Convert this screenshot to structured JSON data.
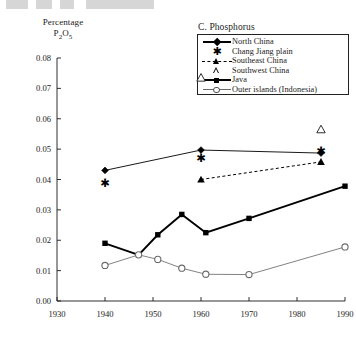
{
  "figure": {
    "panel_title": "C. Phosphorus",
    "y_axis_label_line1": "Percentage",
    "y_axis_label_line2_main": "P",
    "y_axis_label_sub1": "2",
    "y_axis_label_mid": "O",
    "y_axis_label_sub2": "5"
  },
  "legend": {
    "items": [
      {
        "label": "North China",
        "key": "line-diamond",
        "color": "#000000"
      },
      {
        "label": "Chang Jiang plain",
        "key": "star",
        "color": "#000000"
      },
      {
        "label": "Southeast China",
        "key": "dashed-triangle",
        "color": "#000000"
      },
      {
        "label": "Southwest China",
        "key": "open-triangle",
        "color": "#000000"
      },
      {
        "label": "Java",
        "key": "thick-line-square",
        "color": "#000000"
      },
      {
        "label": "Outer islands (Indonesia)",
        "key": "thin-line-circle",
        "color": "#6b6b6b"
      }
    ]
  },
  "chart_data": {
    "type": "line",
    "title": "C. Phosphorus",
    "xlabel": "",
    "ylabel": "Percentage P2O5",
    "xlim": [
      1930,
      1990
    ],
    "ylim": [
      0.0,
      0.08
    ],
    "xticks": [
      1930,
      1940,
      1950,
      1960,
      1970,
      1980,
      1990
    ],
    "xticklabels": [
      "1930",
      "1940",
      "1950",
      "1960",
      "1970",
      "1980",
      "1990"
    ],
    "yticks": [
      0.0,
      0.01,
      0.02,
      0.03,
      0.04,
      0.05,
      0.06,
      0.07,
      0.08
    ],
    "yticklabels": [
      "0.00",
      "0.01",
      "0.02",
      "0.03",
      "0.04",
      "0.05",
      "0.06",
      "0.07",
      "0.08"
    ],
    "grid": false,
    "legend_position": "top-right",
    "series": [
      {
        "name": "North China",
        "marker": "diamond",
        "linestyle": "solid",
        "color": "#000000",
        "points": [
          {
            "x": 1940,
            "y": 0.043
          },
          {
            "x": 1960,
            "y": 0.0497
          },
          {
            "x": 1985,
            "y": 0.0487
          }
        ]
      },
      {
        "name": "Chang Jiang plain",
        "marker": "star",
        "linestyle": "none",
        "color": "#000000",
        "points": [
          {
            "x": 1940,
            "y": 0.039
          },
          {
            "x": 1960,
            "y": 0.047
          },
          {
            "x": 1985,
            "y": 0.0495
          }
        ]
      },
      {
        "name": "Southeast China",
        "marker": "triangle-filled",
        "linestyle": "dashed",
        "color": "#000000",
        "points": [
          {
            "x": 1960,
            "y": 0.04
          },
          {
            "x": 1985,
            "y": 0.0458
          }
        ]
      },
      {
        "name": "Southwest China",
        "marker": "triangle-open",
        "linestyle": "none",
        "color": "#000000",
        "points": [
          {
            "x": 1960,
            "y": 0.0735
          },
          {
            "x": 1985,
            "y": 0.0565
          }
        ]
      },
      {
        "name": "Java",
        "marker": "square",
        "linestyle": "solid-thick",
        "color": "#000000",
        "points": [
          {
            "x": 1940,
            "y": 0.019
          },
          {
            "x": 1947,
            "y": 0.0152
          },
          {
            "x": 1951,
            "y": 0.0218
          },
          {
            "x": 1956,
            "y": 0.0285
          },
          {
            "x": 1961,
            "y": 0.0225
          },
          {
            "x": 1970,
            "y": 0.0272
          },
          {
            "x": 1990,
            "y": 0.0378
          }
        ]
      },
      {
        "name": "Outer islands (Indonesia)",
        "marker": "circle-open",
        "linestyle": "solid-thin",
        "color": "#6b6b6b",
        "points": [
          {
            "x": 1940,
            "y": 0.0117
          },
          {
            "x": 1947,
            "y": 0.0152
          },
          {
            "x": 1951,
            "y": 0.0137
          },
          {
            "x": 1956,
            "y": 0.0108
          },
          {
            "x": 1961,
            "y": 0.0088
          },
          {
            "x": 1970,
            "y": 0.0087
          },
          {
            "x": 1990,
            "y": 0.0178
          }
        ]
      }
    ]
  }
}
